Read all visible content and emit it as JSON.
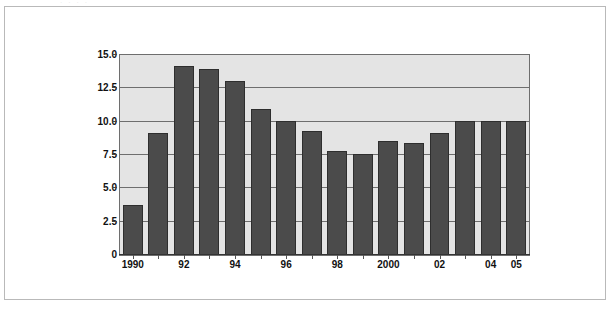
{
  "figure": {
    "scan_artifact_text": "· ·        ·              ·"
  },
  "chart_data": {
    "type": "bar",
    "title": "",
    "subtitle": "",
    "xlabel": "",
    "ylabel": "",
    "categories": [
      "1990",
      "1991",
      "1992",
      "1993",
      "1994",
      "1995",
      "1996",
      "1997",
      "1998",
      "1999",
      "2000",
      "2001",
      "2002",
      "2003",
      "2004",
      "2005"
    ],
    "tick_labels": [
      {
        "category": "1990",
        "label": "1990"
      },
      {
        "category": "1991",
        "label": ""
      },
      {
        "category": "1992",
        "label": "92"
      },
      {
        "category": "1993",
        "label": ""
      },
      {
        "category": "1994",
        "label": "94"
      },
      {
        "category": "1995",
        "label": ""
      },
      {
        "category": "1996",
        "label": "96"
      },
      {
        "category": "1997",
        "label": ""
      },
      {
        "category": "1998",
        "label": "98"
      },
      {
        "category": "1999",
        "label": ""
      },
      {
        "category": "2000",
        "label": "2000"
      },
      {
        "category": "2001",
        "label": ""
      },
      {
        "category": "2002",
        "label": "02"
      },
      {
        "category": "2003",
        "label": ""
      },
      {
        "category": "2004",
        "label": "04"
      },
      {
        "category": "2005",
        "label": "05"
      }
    ],
    "values": [
      3.7,
      9.1,
      14.1,
      13.9,
      13.0,
      10.9,
      10.0,
      9.25,
      7.75,
      7.5,
      8.45,
      8.3,
      9.05,
      10.0,
      10.0,
      10.0
    ],
    "ylim": [
      0,
      15
    ],
    "y_ticks": [
      0,
      2.5,
      5.0,
      7.5,
      10.0,
      12.5,
      15.0
    ],
    "y_tick_labels": [
      "0",
      "2.5",
      "5.0",
      "7.5",
      "10.0",
      "12.5",
      "15.0"
    ],
    "grid": true,
    "legend": null,
    "legend_position": "none",
    "colors": {
      "bar_fill": "#4b4b4b",
      "bar_edge": "#2e2e2e",
      "plot_background": "#e4e4e4",
      "gridline": "#6e6e6e",
      "axis": "#333333",
      "frame_border": "#b9b9b9",
      "page_background": "#ffffff",
      "text": "#111111"
    }
  }
}
